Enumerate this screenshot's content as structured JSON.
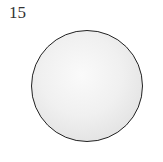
{
  "figure": {
    "label": "15",
    "shape": "circle",
    "fill_color": "#f0f0f0",
    "stroke_color": "#222222"
  }
}
